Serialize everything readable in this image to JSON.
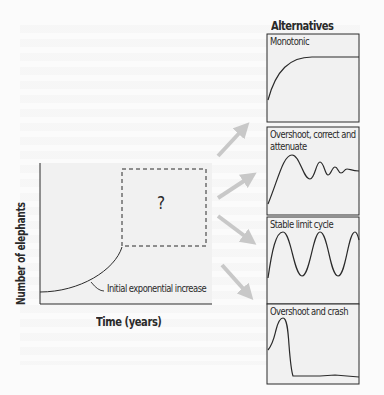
{
  "main_plot": {
    "y_label": "Number of elephants",
    "x_label": "Time (years)",
    "curve_annotation": "Initial exponential increase",
    "unknown_marker": "?"
  },
  "alternatives": {
    "title": "Alternatives",
    "panels": [
      {
        "label": "Monotonic"
      },
      {
        "label_line1": "Overshoot, correct and",
        "label_line2": "attenuate"
      },
      {
        "label": "Stable limit cycle"
      },
      {
        "label": "Overshoot and crash"
      }
    ]
  },
  "colors": {
    "panel_bg": "#f1f1f1",
    "line": "#2a2a2a",
    "arrow": "#c8c8c8"
  }
}
